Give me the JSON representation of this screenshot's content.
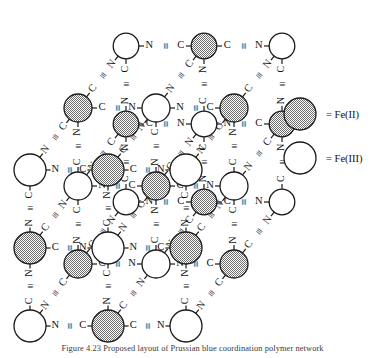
{
  "figure": {
    "caption": "Figure 4.23  Proposed layout of Prussian blue coordination polymer network"
  },
  "legend": {
    "items": [
      {
        "marker": "filled-circle",
        "label": "= Fe(II)",
        "color": "#8f8f8f"
      },
      {
        "marker": "open-circle",
        "label": "= Fe(III)",
        "color": "#ffffff"
      }
    ]
  },
  "colors": {
    "stroke": "#1a1a1a",
    "fe2_fill": "#9a9a9a",
    "fe3_fill": "#ffffff",
    "text": "#111111"
  },
  "chemistry": {
    "bridge_labels": [
      "N",
      "C"
    ],
    "triple_bond": "≡",
    "bridge_forward": "N≡C",
    "bridge_reverse": "C≡N"
  },
  "structure": {
    "type": "cubic-lattice-oblique-projection",
    "dimensions": [
      3,
      3,
      3
    ],
    "depth_offset": {
      "dx": 48,
      "dy": -62
    },
    "spacing": {
      "x": 78,
      "y": 78
    },
    "origin": {
      "x": 30,
      "y": 326
    },
    "radius_front": 16,
    "radius_back": 14,
    "site_rule": "alternating Fe(II)/Fe(III) by parity of (i+j+k)"
  }
}
